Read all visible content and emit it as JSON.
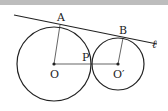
{
  "figure": {
    "labels": {
      "A": "A",
      "B": "B",
      "P": "P",
      "O": "O",
      "O_prime": "O′",
      "line": "ℓ"
    },
    "colors": {
      "stroke": "#222222",
      "background": "#ffffff",
      "top_band": "#bdbdbd"
    },
    "circles": [
      {
        "name": "O",
        "cx": 54,
        "cy": 64,
        "r": 37
      },
      {
        "name": "O′",
        "cx": 118,
        "cy": 64,
        "r": 26
      }
    ],
    "tangent_line": {
      "x1": 14,
      "y1": 15,
      "x2": 157,
      "y2": 44
    },
    "points": {
      "A": {
        "x": 58,
        "y": 24
      },
      "B": {
        "x": 122,
        "y": 38
      },
      "P": {
        "x": 92,
        "y": 64
      },
      "O": {
        "x": 54,
        "y": 64
      },
      "O_prime": {
        "x": 118,
        "y": 64
      }
    }
  }
}
